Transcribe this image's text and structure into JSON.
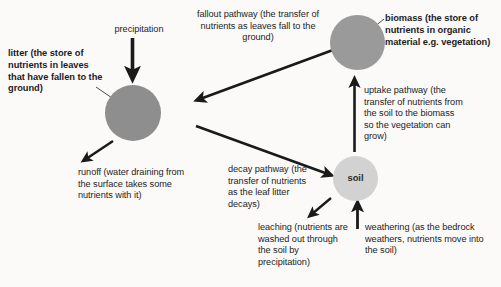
{
  "diagram": {
    "background_color": "#fbfaf8",
    "stroke_color": "#1a1a1a",
    "stores": [
      {
        "id": "litter",
        "circle_fill": "#8e8e8e",
        "label": "litter (the store of nutrients in leaves that have fallen to the ground)",
        "label_bold": true
      },
      {
        "id": "biomass",
        "circle_fill": "#9a9a9a",
        "label": "biomass (the store of nutrients in organic material e.g. vegetation)",
        "label_bold": true
      },
      {
        "id": "soil",
        "circle_fill": "#d2d2d2",
        "label": "soil",
        "label_bold": true
      }
    ],
    "flows": [
      {
        "id": "precipitation",
        "label": "precipitation",
        "direction": "down",
        "from": "sky",
        "to": "litter"
      },
      {
        "id": "fallout",
        "label": "fallout pathway (the transfer of nutrients as leaves fall to the ground)",
        "direction": "down-left",
        "from": "biomass",
        "to": "litter"
      },
      {
        "id": "uptake",
        "label": "uptake pathway (the transfer of nutrients from the soil to the biomass so the vegetation can grow)",
        "direction": "up",
        "from": "soil",
        "to": "biomass"
      },
      {
        "id": "runoff",
        "label": "runoff (water draining from the surface takes some nutrients with it)",
        "direction": "down-left",
        "from": "litter",
        "to": "out"
      },
      {
        "id": "decay",
        "label": "decay pathway (the transfer of nutrients as the leaf litter decays)",
        "direction": "down-right",
        "from": "litter",
        "to": "soil"
      },
      {
        "id": "leaching",
        "label": "leaching (nutrients are washed out through the soil by precipitation)",
        "direction": "down-left",
        "from": "soil",
        "to": "out"
      },
      {
        "id": "weathering",
        "label": "weathering (as the bedrock weathers, nutrients move into the soil)",
        "direction": "up",
        "from": "bedrock",
        "to": "soil"
      }
    ]
  }
}
